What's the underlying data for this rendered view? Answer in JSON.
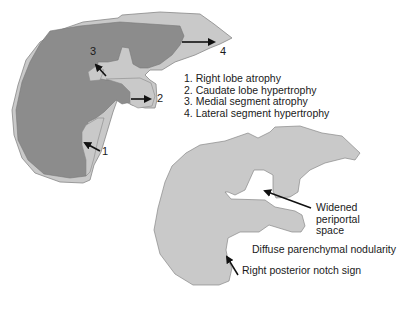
{
  "colors": {
    "light_gray": "#c9c9c9",
    "dark_gray": "#8c8c8c",
    "outline": "#777777",
    "arrow": "#111111",
    "text": "#1a1a1a"
  },
  "top_diagram": {
    "markers": [
      "1",
      "2",
      "3",
      "4"
    ],
    "legend": [
      "1. Right lobe atrophy",
      "2. Caudate lobe hypertrophy",
      "3. Medial segment atrophy",
      "4. Lateral segment hypertrophy"
    ]
  },
  "bottom_diagram": {
    "labels": {
      "widened_line1": "Widened",
      "widened_line2": "periportal",
      "widened_line3": "space",
      "nodularity": "Diffuse parenchymal nodularity",
      "notch": "Right posterior notch sign"
    }
  }
}
